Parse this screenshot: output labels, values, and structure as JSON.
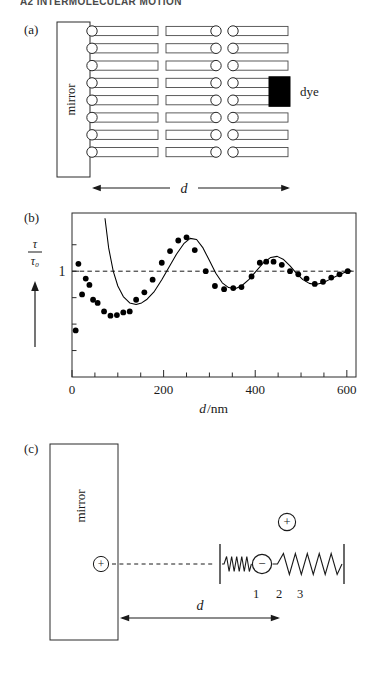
{
  "page": {
    "running_head": "A2 INTERMOLECULAR MOTION",
    "width": 377,
    "height": 689,
    "background": "#ffffff",
    "ink": "#1a1a1a"
  },
  "panel_a": {
    "label": "(a)",
    "mirror_label": "mirror",
    "dye_label": "dye",
    "distance_label": "d",
    "rows": 8,
    "columns": 3,
    "dye_color": "#000000",
    "molecule_fill": "#ffffff",
    "molecule_stroke": "#3a3a3a"
  },
  "panel_b": {
    "label": "(b)",
    "axis_arrow_present": true
  },
  "panel_c": {
    "label": "(c)",
    "mirror_label": "mirror",
    "distance_label": "d",
    "dipole_plus_label": "+",
    "image_plus_label": "+",
    "oscillator_minus_label": "−",
    "spring_labels": [
      "1",
      "2",
      "3"
    ]
  },
  "chart_data": {
    "type": "scatter",
    "title": "",
    "xlabel": "d/nm",
    "ylabel": "τ/τ₀",
    "ylabel_numerator": "τ",
    "ylabel_denominator": "τ₀",
    "xlim": [
      0,
      620
    ],
    "ylim": [
      0.0,
      1.55
    ],
    "xticks": [
      0,
      50,
      100,
      150,
      200,
      250,
      300,
      350,
      400,
      450,
      500,
      550,
      600
    ],
    "xticklabels": [
      "0",
      "",
      "",
      "",
      "200",
      "",
      "",
      "",
      "400",
      "",
      "",
      "",
      "600"
    ],
    "yticks": [
      0.25,
      0.5,
      0.75,
      1.0,
      1.25
    ],
    "yticklabels": [
      "",
      "",
      "",
      "1",
      ""
    ],
    "reference_line": {
      "y": 1.0,
      "style": "dashed",
      "label": "1"
    },
    "grid": false,
    "legend": null,
    "series": [
      {
        "name": "measured lifetime ratio",
        "marker": "filled-circle",
        "color": "#000000",
        "points": [
          [
            8,
            0.44
          ],
          [
            14,
            1.07
          ],
          [
            22,
            0.78
          ],
          [
            30,
            0.93
          ],
          [
            38,
            0.87
          ],
          [
            46,
            0.73
          ],
          [
            56,
            0.7
          ],
          [
            70,
            0.62
          ],
          [
            84,
            0.58
          ],
          [
            98,
            0.585
          ],
          [
            112,
            0.61
          ],
          [
            126,
            0.62
          ],
          [
            140,
            0.73
          ],
          [
            158,
            0.8
          ],
          [
            176,
            0.92
          ],
          [
            196,
            1.08
          ],
          [
            214,
            1.19
          ],
          [
            232,
            1.29
          ],
          [
            250,
            1.32
          ],
          [
            268,
            1.2
          ],
          [
            292,
            1.0
          ],
          [
            312,
            0.86
          ],
          [
            332,
            0.83
          ],
          [
            352,
            0.84
          ],
          [
            370,
            0.85
          ],
          [
            392,
            0.95
          ],
          [
            410,
            1.08
          ],
          [
            424,
            1.09
          ],
          [
            440,
            1.09
          ],
          [
            458,
            1.06
          ],
          [
            476,
            1.0
          ],
          [
            494,
            0.97
          ],
          [
            512,
            0.93
          ],
          [
            530,
            0.88
          ],
          [
            548,
            0.9
          ],
          [
            566,
            0.94
          ],
          [
            584,
            0.97
          ],
          [
            602,
            1.0
          ]
        ]
      },
      {
        "name": "theoretical curve",
        "marker": "line",
        "color": "#000000",
        "points": [
          [
            72,
            1.5
          ],
          [
            80,
            1.22
          ],
          [
            90,
            1.0
          ],
          [
            100,
            0.86
          ],
          [
            112,
            0.76
          ],
          [
            126,
            0.7
          ],
          [
            140,
            0.685
          ],
          [
            152,
            0.7
          ],
          [
            164,
            0.735
          ],
          [
            180,
            0.81
          ],
          [
            196,
            0.92
          ],
          [
            212,
            1.04
          ],
          [
            228,
            1.16
          ],
          [
            244,
            1.26
          ],
          [
            258,
            1.31
          ],
          [
            272,
            1.3
          ],
          [
            286,
            1.22
          ],
          [
            300,
            1.1
          ],
          [
            314,
            0.98
          ],
          [
            328,
            0.89
          ],
          [
            342,
            0.845
          ],
          [
            356,
            0.835
          ],
          [
            370,
            0.86
          ],
          [
            386,
            0.92
          ],
          [
            402,
            1.0
          ],
          [
            418,
            1.08
          ],
          [
            434,
            1.13
          ],
          [
            448,
            1.14
          ],
          [
            462,
            1.11
          ],
          [
            476,
            1.05
          ],
          [
            490,
            0.98
          ],
          [
            504,
            0.92
          ],
          [
            518,
            0.885
          ],
          [
            532,
            0.875
          ],
          [
            548,
            0.89
          ],
          [
            564,
            0.925
          ],
          [
            580,
            0.96
          ],
          [
            596,
            0.99
          ],
          [
            610,
            1.005
          ]
        ]
      }
    ]
  }
}
